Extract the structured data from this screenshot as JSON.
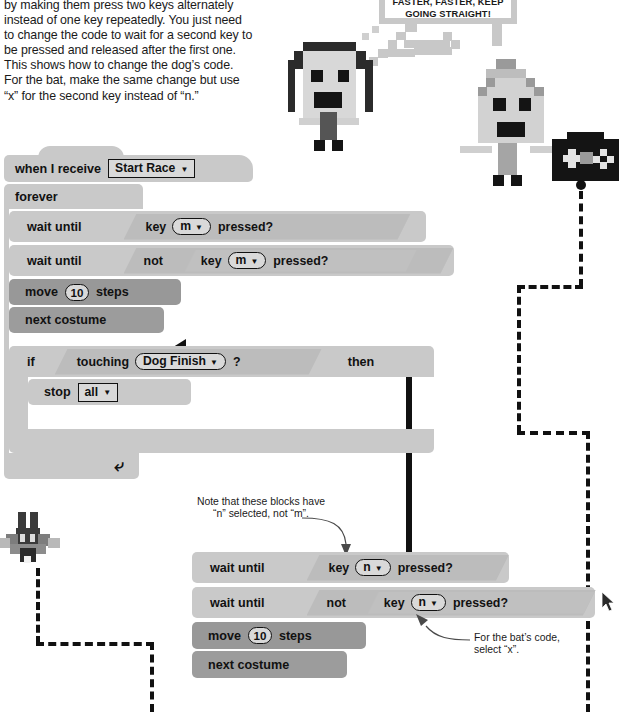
{
  "intro": {
    "paragraph": "by making them press two keys alternately instead of one key repeatedly. You just need to change the code to wait for a second key to be pressed and released after the first one. This shows how to change the dog’s code. For the bat, make the same change but use “x” for the second key instead of “n.”"
  },
  "speech_bubble": {
    "line1": "FASTER, FASTER, KEEP",
    "line2": "GOING STRAIGHT!"
  },
  "dog_script": {
    "hat": {
      "prefix": "when I receive",
      "dropdown": "Start Race"
    },
    "forever": "forever",
    "rows": [
      {
        "label": "wait until",
        "reporter": "key",
        "key": "m",
        "suffix": "pressed?"
      },
      {
        "label": "wait until",
        "not": "not",
        "reporter": "key",
        "key": "m",
        "suffix": "pressed?"
      }
    ],
    "move": {
      "prefix": "move",
      "value": "10",
      "suffix": "steps"
    },
    "next_costume": "next costume",
    "if_block": {
      "prefix": "if",
      "reporter": "touching",
      "target": "Dog Finish",
      "qmark": "?",
      "then": "then"
    },
    "stop": {
      "prefix": "stop",
      "dropdown": "all"
    }
  },
  "bat_script": {
    "rows": [
      {
        "label": "wait until",
        "reporter": "key",
        "key": "n",
        "suffix": "pressed?"
      },
      {
        "label": "wait until",
        "not": "not",
        "reporter": "key",
        "key": "n",
        "suffix": "pressed?"
      }
    ],
    "move": {
      "prefix": "move",
      "value": "10",
      "suffix": "steps"
    },
    "next_costume": "next costume"
  },
  "annotations": {
    "note_n_keys": "Note that these blocks have “n” selected, not “m”.",
    "note_bat_x": "For the bat’s code, select “x”."
  },
  "colors": {
    "control_block": "#c9c9c9",
    "motion_block": "#989898",
    "looks_block": "#9c9c9c",
    "sensing_reporter": "#c0c0c0",
    "dropdown_fill": "#d9d9d9",
    "bubble_border": "#c8c8c8",
    "ink": "#111111"
  }
}
